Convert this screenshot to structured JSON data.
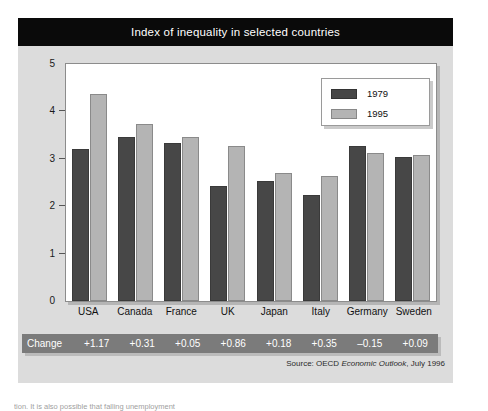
{
  "figure": {
    "title": "Index of inequality in selected countries",
    "source_prefix": "Source: OECD ",
    "source_italic": "Economic Outlook",
    "source_suffix": ", July 1996",
    "change_label": "Change"
  },
  "legend": {
    "position": "top-right",
    "entries": [
      {
        "label": "1979",
        "color": "#474747"
      },
      {
        "label": "1995",
        "color": "#b4b4b4"
      }
    ]
  },
  "colors": {
    "title_bar": "#0a0a0a",
    "title_text": "#ffffff",
    "figure_background": "#dcdcdc",
    "plot_background": "#ffffff",
    "series_1979": "#474747",
    "series_1995": "#b4b4b4",
    "change_strip": "#7b7b7b"
  },
  "y_axis": {
    "ticks": [
      "0",
      "1",
      "2",
      "3",
      "4",
      "5"
    ],
    "min": 0,
    "max": 5
  },
  "change_row": {
    "values": [
      "+1.17",
      "+0.31",
      "+0.05",
      "+0.86",
      "+0.18",
      "+0.35",
      "–0.15",
      "+0.09"
    ]
  },
  "body_text": "tion. It is also possible that falling unemployment",
  "chart_data": {
    "type": "bar",
    "title": "Index of inequality in selected countries",
    "xlabel": "",
    "ylabel": "",
    "ylim": [
      0,
      5
    ],
    "grid": false,
    "legend_position": "top-right",
    "categories": [
      "USA",
      "Canada",
      "France",
      "UK",
      "Japan",
      "Italy",
      "Germany",
      "Sweden"
    ],
    "series": [
      {
        "name": "1979",
        "color": "#474747",
        "values": [
          3.2,
          3.47,
          3.33,
          2.42,
          2.53,
          2.24,
          3.28,
          3.03
        ]
      },
      {
        "name": "1995",
        "color": "#b4b4b4",
        "values": [
          4.37,
          3.73,
          3.46,
          3.28,
          2.71,
          2.63,
          3.12,
          3.07
        ]
      }
    ],
    "annotations": {
      "row_label": "Change",
      "row_values": [
        "+1.17",
        "+0.31",
        "+0.05",
        "+0.86",
        "+0.18",
        "+0.35",
        "–0.15",
        "+0.09"
      ]
    },
    "source": "Source: OECD Economic Outlook, July 1996"
  }
}
